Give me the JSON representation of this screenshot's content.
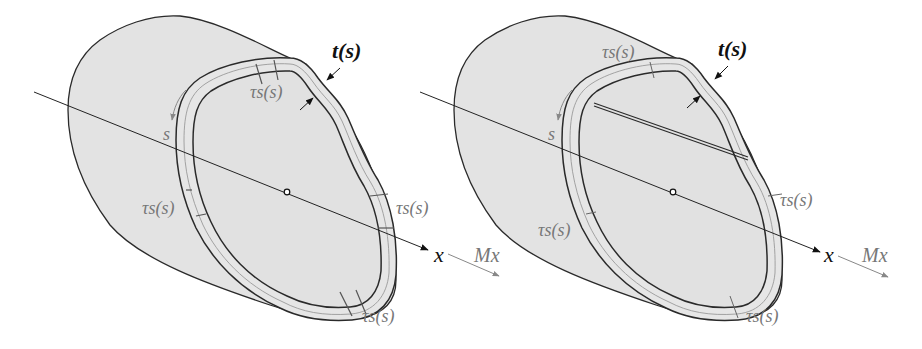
{
  "figure": {
    "colors": {
      "background": "#ffffff",
      "body_fill": "#e3e3e3",
      "outline": "#2a2a2a",
      "label_dark": "#111111",
      "label_grey": "#777777"
    }
  },
  "left_panel": {
    "name": "single-cell section",
    "labels": {
      "thickness": "t(s)",
      "arc_coordinate": "s",
      "axis": "x",
      "shear_top": "τs(s)",
      "shear_left": "τs(s)",
      "shear_right": "τs(s)",
      "shear_bottom": "τs(s)"
    }
  },
  "right_panel": {
    "name": "two-cell section with web",
    "labels": {
      "thickness": "t(s)",
      "arc_coordinate": "s",
      "axis": "x",
      "moment_left": "Mx",
      "moment_right": "Mx",
      "shear_top": "τs(s)",
      "shear_left": "τs(s)",
      "shear_right": "τs(s)",
      "shear_bottom": "τs(s)"
    }
  }
}
